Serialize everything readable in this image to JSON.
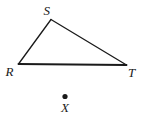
{
  "figure": {
    "type": "geometry-diagram",
    "background_color": "#ffffff",
    "stroke_color": "#1a1a1a",
    "width": 156,
    "height": 121
  },
  "triangle": {
    "name": "triangle-RST",
    "stroke_width": 1.3,
    "base_stroke_width": 1.9,
    "vertices": [
      {
        "label": "R",
        "x": 18.5,
        "y": 64.0,
        "label_x": 5.5,
        "label_y": 65.0
      },
      {
        "label": "S",
        "x": 51.0,
        "y": 19.5,
        "label_x": 43.5,
        "label_y": 4.0
      },
      {
        "label": "T",
        "x": 126.5,
        "y": 65.0,
        "label_x": 128.0,
        "label_y": 65.5
      }
    ],
    "edges": [
      {
        "name": "edge-RS",
        "from": "R",
        "to": "S"
      },
      {
        "name": "edge-ST",
        "from": "S",
        "to": "T"
      },
      {
        "name": "edge-RT",
        "from": "R",
        "to": "T"
      }
    ]
  },
  "point": {
    "name": "point-X",
    "label": "X",
    "dot_x": 65.0,
    "dot_y": 96.5,
    "dot_radius": 2.6,
    "label_x": 61.0,
    "label_y": 101.0
  }
}
